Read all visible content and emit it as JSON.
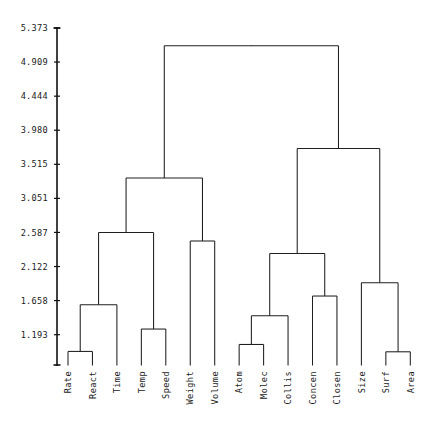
{
  "chart_data": {
    "type": "dendrogram",
    "title": "",
    "subtitle": "",
    "xlabel": "",
    "ylabel": "",
    "grid": false,
    "legend": "none",
    "orientation": "vertical",
    "leaf_label_rotation": -90,
    "categories": [
      "Rate",
      "React",
      "Time",
      "Temp",
      "Speed",
      "Weight",
      "Volume",
      "Atom",
      "Molec",
      "Collis",
      "Concen",
      "Closen",
      "Size",
      "Surf",
      "Area"
    ],
    "yticks": [
      1.193,
      1.658,
      2.122,
      2.587,
      3.051,
      3.515,
      3.98,
      4.444,
      4.909,
      5.373
    ],
    "ytick_labels": [
      "1.193",
      "1.658",
      "2.122",
      "2.587",
      "3.051",
      "3.515",
      "3.980",
      "4.444",
      "4.909",
      "5.373"
    ],
    "ylim": [
      0.78,
      5.44
    ],
    "axis_baseline": 0.78,
    "merges": [
      {
        "id": "m1",
        "label": "Rate + React",
        "left": "Rate",
        "right": "React",
        "height": 0.965
      },
      {
        "id": "m2",
        "label": "Temp + Speed",
        "left": "Temp",
        "right": "Speed",
        "height": 1.27
      },
      {
        "id": "m3",
        "label": "Atom + Molec",
        "left": "Atom",
        "right": "Molec",
        "height": 1.06
      },
      {
        "id": "m4",
        "label": "Surf + Area",
        "left": "Surf",
        "right": "Area",
        "height": 0.96
      },
      {
        "id": "m5",
        "label": "(Rate,React) + Time",
        "left": "m1",
        "right": "Time",
        "height": 1.6
      },
      {
        "id": "m6",
        "label": "(Atom,Molec) + Collis",
        "left": "m3",
        "right": "Collis",
        "height": 1.45
      },
      {
        "id": "m7",
        "label": "Concen + Closen",
        "left": "Concen",
        "right": "Closen",
        "height": 1.72
      },
      {
        "id": "m8",
        "label": "Size + (Surf,Area)",
        "left": "Size",
        "right": "m4",
        "height": 1.9
      },
      {
        "id": "m9",
        "label": "(Rate,React,Time) + (Temp,Speed)",
        "left": "m5",
        "right": "m2",
        "height": 2.587
      },
      {
        "id": "m10",
        "label": "Weight + Volume",
        "left": "Weight",
        "right": "Volume",
        "height": 2.47
      },
      {
        "id": "m11",
        "label": "(Atom,Molec,Collis) + (Concen,Closen)",
        "left": "m6",
        "right": "m7",
        "height": 2.3
      },
      {
        "id": "m12",
        "label": "kinetics cluster + (Weight,Volume)",
        "left": "m9",
        "right": "m10",
        "height": 3.33
      },
      {
        "id": "m13",
        "label": "molecular cluster + size cluster",
        "left": "m11",
        "right": "m8",
        "height": 3.73
      },
      {
        "id": "m14",
        "label": "root",
        "left": "m12",
        "right": "m13",
        "height": 5.13
      }
    ]
  }
}
